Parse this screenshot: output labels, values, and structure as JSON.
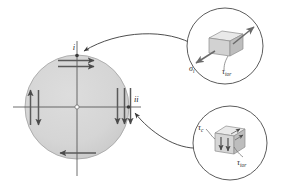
{
  "figure": {
    "background_color": "#ffffff",
    "line_color": "#3a3a3a",
    "disc_fill_color": "#d6d6d6",
    "disc_edge_color": "#9a9a9a",
    "cube_top_color": "#e8e8e8",
    "cube_front_color": "#cfcfcf",
    "cube_side_color": "#b5b5b5",
    "arrow_color": "#555555"
  },
  "disc": {
    "name": "shaft-cross-section",
    "point_i_label": "i",
    "point_ii_label": "ii",
    "horizontal_axis_label": "",
    "vertical_axis_label": "",
    "center_marker": "o"
  },
  "callout_top": {
    "name": "stress-element-i",
    "sigma_label": "σ",
    "sigma_subscript": "i",
    "tau_label": "τ",
    "tau_subscript": "tor"
  },
  "callout_bottom": {
    "name": "stress-element-ii",
    "tau_c_label": "τ",
    "tau_c_subscript": "c",
    "tau_label": "τ",
    "tau_subscript": "tor"
  }
}
